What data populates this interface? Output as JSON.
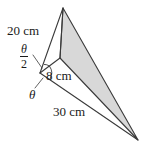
{
  "figure": {
    "background_color": "#ffffff",
    "stroke_color": "#3a3a3a",
    "shade_color": "#d8d8d8",
    "labels": {
      "side_20": "20 cm",
      "side_8": "8 cm",
      "side_30": "30 cm",
      "angle_theta": "θ",
      "angle_half_numerator": "θ",
      "angle_half_denominator": "2"
    },
    "vertices": {
      "apex": {
        "x": 63,
        "y": 8
      },
      "center": {
        "x": 60,
        "y": 58
      },
      "left": {
        "x": 40,
        "y": 73
      },
      "bottom_right": {
        "x": 138,
        "y": 140
      }
    },
    "measurements": [
      {
        "name": "upper-left-edge",
        "value": 20,
        "unit": "cm",
        "label": "20 cm"
      },
      {
        "name": "short-edge",
        "value": 8,
        "unit": "cm",
        "label": "8 cm"
      },
      {
        "name": "lower-edge",
        "value": 30,
        "unit": "cm",
        "label": "30 cm"
      }
    ],
    "angles": [
      {
        "name": "half-theta",
        "label": "θ/2"
      },
      {
        "name": "theta",
        "label": "θ"
      }
    ]
  }
}
